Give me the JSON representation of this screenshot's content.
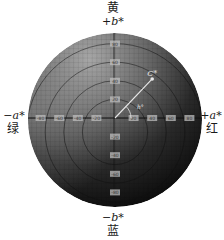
{
  "diagram": {
    "center": {
      "x": 115,
      "y": 118
    },
    "radius_px": 87,
    "scale_px_per_unit": 0.93,
    "colors": {
      "edge_top": "#a8a8a8",
      "edge_left": "#9a9a9a",
      "center": "#3a3a3a",
      "bottom_right": "#050505",
      "grid": "#000000",
      "axis_line": "#111111",
      "tick_label_bg": "#bdbdbd",
      "vector": "#e8e8e8"
    }
  },
  "labels": {
    "top": {
      "cn": "黄",
      "axis": "+b*"
    },
    "bottom": {
      "cn": "蓝",
      "axis": "−b*"
    },
    "left": {
      "cn": "绿",
      "axis": "−a*"
    },
    "right": {
      "cn": "红",
      "axis": "+a*"
    }
  },
  "axis_ticks": {
    "a": [
      "-80",
      "-60",
      "-40",
      "-20",
      "20",
      "40",
      "60",
      "80"
    ],
    "b_positive": [
      "80",
      "60",
      "40",
      "20"
    ],
    "b_negative": [
      "-20",
      "-40",
      "-60",
      "-80"
    ]
  },
  "vector": {
    "chroma_label": "C*",
    "hue_label": "h°",
    "a": 40,
    "b": 42
  },
  "concentric_rings": [
    20,
    40,
    60,
    80
  ]
}
